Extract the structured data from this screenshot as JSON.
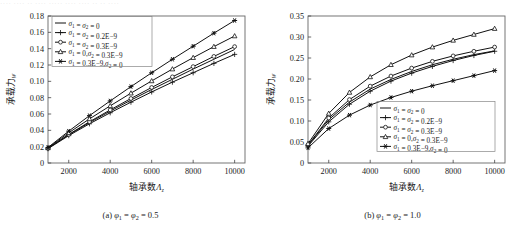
{
  "topstrip": "···· ···· ··  ···· ····· ···· ···· ·· ·· ····",
  "panels": [
    {
      "id": "panel-a",
      "caption_prefix": "(a) ",
      "caption_symbol1": "φ",
      "caption_sub1": "1",
      "caption_mid": " = ",
      "caption_symbol2": "φ",
      "caption_sub2": "2",
      "caption_value": " = 0.5",
      "ylabel_text": "承载力",
      "ylabel_sub": "W",
      "xlabel_text": "轴承数",
      "xlabel_sym": "Λ",
      "xlabel_sub": "z",
      "chart_data": {
        "type": "line",
        "title": "(a) φ₁ = φ₂ = 0.5",
        "xlabel": "轴承数Λ_z",
        "ylabel": "承载力_W",
        "xlim": [
          1000,
          10500
        ],
        "ylim": [
          0,
          0.18
        ],
        "xticks": [
          2000,
          4000,
          6000,
          8000,
          10000
        ],
        "yticks": [
          "0",
          "0.02",
          "0.04",
          "0.06",
          "0.08",
          "0.10",
          "0.12",
          "0.14",
          "0.16",
          "0.18"
        ],
        "grid": false,
        "legend_position": "top-left",
        "x": [
          1000,
          2000,
          3000,
          4000,
          5000,
          6000,
          7000,
          8000,
          9000,
          10000
        ],
        "series": [
          {
            "name": "σ₁ = σ₂ = 0",
            "marker": "none",
            "values": [
              0.018,
              0.0345,
              0.0495,
              0.0635,
              0.077,
              0.09,
              0.1025,
              0.115,
              0.127,
              0.139
            ]
          },
          {
            "name": "σ₁ = σ₂ = 0.2E−9",
            "marker": "plus",
            "values": [
              0.0175,
              0.0335,
              0.048,
              0.0615,
              0.0745,
              0.087,
              0.099,
              0.1105,
              0.122,
              0.133
            ]
          },
          {
            "name": "σ₁ = σ₂ = 0.3E−9",
            "marker": "circle",
            "values": [
              0.018,
              0.035,
              0.0505,
              0.065,
              0.079,
              0.0925,
              0.1055,
              0.118,
              0.1305,
              0.1425
            ]
          },
          {
            "name": "σ₁ = 0,σ₂ = 0.3E−9",
            "marker": "triangle",
            "values": [
              0.0185,
              0.037,
              0.054,
              0.07,
              0.0855,
              0.1005,
              0.115,
              0.129,
              0.1425,
              0.1555
            ]
          },
          {
            "name": "σ₁ = 0.3E−9,σ₂ = 0",
            "marker": "star",
            "values": [
              0.019,
              0.039,
              0.058,
              0.076,
              0.0935,
              0.1105,
              0.127,
              0.143,
              0.159,
              0.1745
            ]
          }
        ]
      }
    },
    {
      "id": "panel-b",
      "caption_prefix": "(b) ",
      "caption_symbol1": "φ",
      "caption_sub1": "1",
      "caption_mid": " = ",
      "caption_symbol2": "φ",
      "caption_sub2": "2",
      "caption_value": " = 1.0",
      "ylabel_text": "承载力",
      "ylabel_sub": "W",
      "xlabel_text": "轴承数",
      "xlabel_sym": "Λ",
      "xlabel_sub": "z",
      "chart_data": {
        "type": "line",
        "title": "(b) φ₁ = φ₂ = 1.0",
        "xlabel": "轴承数Λ_z",
        "ylabel": "承载力_W",
        "xlim": [
          1000,
          10500
        ],
        "ylim": [
          0,
          0.35
        ],
        "xticks": [
          2000,
          4000,
          6000,
          8000,
          10000
        ],
        "yticks": [
          "0",
          "0.05",
          "0.10",
          "0.15",
          "0.20",
          "0.25",
          "0.30",
          "0.35"
        ],
        "grid": false,
        "legend_position": "bottom-right",
        "x": [
          1000,
          2000,
          3000,
          4000,
          5000,
          6000,
          7000,
          8000,
          9000,
          10000
        ],
        "series": [
          {
            "name": "σ₁ = σ₂ = 0",
            "marker": "none",
            "values": [
              0.042,
              0.103,
              0.145,
              0.176,
              0.199,
              0.218,
              0.234,
              0.247,
              0.258,
              0.267
            ]
          },
          {
            "name": "σ₁ = σ₂ = 0.2E−9",
            "marker": "plus",
            "values": [
              0.04,
              0.098,
              0.14,
              0.171,
              0.195,
              0.214,
              0.23,
              0.244,
              0.256,
              0.266
            ]
          },
          {
            "name": "σ₁ = σ₂ = 0.3E−9",
            "marker": "circle",
            "values": [
              0.043,
              0.107,
              0.151,
              0.183,
              0.207,
              0.226,
              0.242,
              0.255,
              0.266,
              0.276
            ]
          },
          {
            "name": "σ₁ = 0,σ₂ = 0.3E−9",
            "marker": "triangle",
            "values": [
              0.046,
              0.118,
              0.168,
              0.205,
              0.234,
              0.257,
              0.276,
              0.292,
              0.306,
              0.32
            ]
          },
          {
            "name": "σ₁ = 0.3E−9,σ₂ = 0",
            "marker": "star",
            "values": [
              0.036,
              0.082,
              0.114,
              0.138,
              0.156,
              0.171,
              0.184,
              0.196,
              0.208,
              0.22
            ]
          }
        ]
      }
    }
  ]
}
